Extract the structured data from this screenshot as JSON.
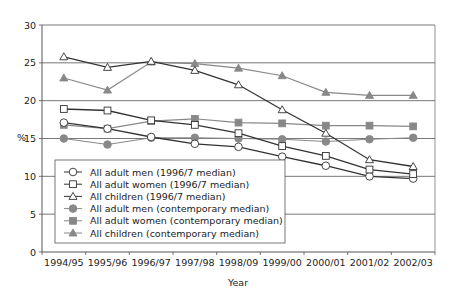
{
  "chart_data": {
    "type": "line",
    "title": "",
    "xlabel": "Year",
    "ylabel": "%",
    "ylim": [
      0,
      30
    ],
    "yticks": [
      0,
      5,
      10,
      15,
      20,
      25,
      30
    ],
    "grid": "horizontal",
    "legend_position": "lower-left inside",
    "categories": [
      "1994/95",
      "1995/96",
      "1996/97",
      "1997/98",
      "1998/09",
      "1999/00",
      "2000/01",
      "2001/02",
      "2002/03"
    ],
    "series": [
      {
        "name": "All adult men (1996/7 median)",
        "marker": "open-circle",
        "color": "#333333",
        "values": [
          17.1,
          16.3,
          15.2,
          14.3,
          13.9,
          12.6,
          11.4,
          10.0,
          9.7
        ]
      },
      {
        "name": "All adult women (1996/7 median)",
        "marker": "open-square",
        "color": "#333333",
        "values": [
          18.9,
          18.7,
          17.4,
          16.8,
          15.7,
          14.0,
          12.7,
          10.9,
          10.3
        ]
      },
      {
        "name": "All children (1996/7 median)",
        "marker": "open-triangle",
        "color": "#333333",
        "values": [
          25.8,
          24.4,
          25.2,
          24.0,
          22.1,
          18.8,
          15.7,
          12.2,
          11.3
        ]
      },
      {
        "name": "All adult men (contemporary median)",
        "marker": "filled-circle",
        "color": "#888888",
        "values": [
          15.0,
          14.2,
          15.1,
          15.1,
          15.0,
          14.9,
          14.6,
          14.9,
          15.1
        ]
      },
      {
        "name": "All adult women (contemporary median)",
        "marker": "filled-square",
        "color": "#888888",
        "values": [
          16.8,
          16.3,
          17.3,
          17.6,
          17.1,
          17.0,
          16.7,
          16.7,
          16.6
        ]
      },
      {
        "name": "All children (contemporary median)",
        "marker": "filled-triangle",
        "color": "#888888",
        "values": [
          23.0,
          21.4,
          25.1,
          24.9,
          24.3,
          23.3,
          21.1,
          20.7,
          20.7
        ]
      }
    ]
  },
  "labels": {
    "y_axis_title": "%",
    "x_axis_title": "Year"
  }
}
